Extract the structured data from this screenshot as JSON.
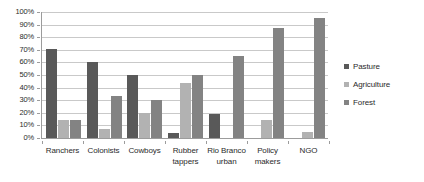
{
  "chart_data": {
    "type": "bar",
    "title": "",
    "subtitle": "",
    "xlabel": "",
    "ylabel": "",
    "ylim": [
      0,
      100
    ],
    "yunit": "%",
    "grid": true,
    "legend_position": "right",
    "categories": [
      "Ranchers",
      "Colonists",
      "Cowboys",
      "Rubber tappers",
      "Rio Branco urban",
      "Policy makers",
      "NGO"
    ],
    "category_lines": [
      [
        "Ranchers"
      ],
      [
        "Colonists"
      ],
      [
        "Cowboys"
      ],
      [
        "Rubber",
        "tappers"
      ],
      [
        "Rio Branco",
        "urban"
      ],
      [
        "Policy",
        "makers"
      ],
      [
        "NGO"
      ]
    ],
    "series": [
      {
        "name": "Pasture",
        "color": "#595959",
        "values": [
          71,
          60,
          50,
          4,
          19,
          0,
          0
        ]
      },
      {
        "name": "Agriculture",
        "color": "#b2b2b2",
        "values": [
          14,
          7,
          20,
          44,
          0,
          14,
          5
        ]
      },
      {
        "name": "Forest",
        "color": "#838383",
        "values": [
          14,
          33,
          30,
          50,
          65,
          87,
          95
        ]
      }
    ],
    "yticks": [
      "0%",
      "10%",
      "20%",
      "30%",
      "40%",
      "50%",
      "60%",
      "70%",
      "80%",
      "90%",
      "100%"
    ],
    "ytick_values": [
      0,
      10,
      20,
      30,
      40,
      50,
      60,
      70,
      80,
      90,
      100
    ]
  }
}
